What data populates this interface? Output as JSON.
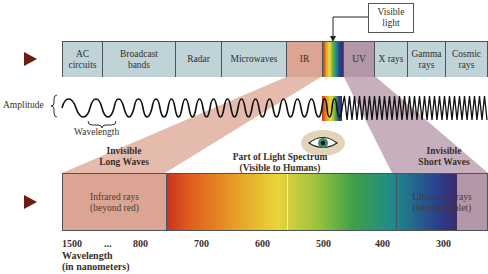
{
  "top_band": {
    "cells": [
      {
        "label": "AC circuits",
        "line1": "AC",
        "line2": "circuits",
        "color": "#bfd3d8"
      },
      {
        "label": "Broadcast bands",
        "line1": "Broadcast",
        "line2": "bands",
        "color": "#bfd3d8"
      },
      {
        "label": "Radar",
        "line1": "Radar",
        "line2": "",
        "color": "#bfd3d8"
      },
      {
        "label": "Microwaves",
        "line1": "Microwaves",
        "line2": "",
        "color": "#bfd3d8"
      },
      {
        "label": "IR",
        "line1": "IR",
        "line2": "",
        "color": "#dca493"
      },
      {
        "label": "Visible",
        "line1": "",
        "line2": "",
        "color": "rainbow"
      },
      {
        "label": "UV",
        "line1": "UV",
        "line2": "",
        "color": "#b396a8"
      },
      {
        "label": "X rays",
        "line1": "X rays",
        "line2": "",
        "color": "#bfd3d8"
      },
      {
        "label": "Gamma rays",
        "line1": "Gamma",
        "line2": "rays",
        "color": "#bfd3d8"
      },
      {
        "label": "Cosmic rays",
        "line1": "Cosmic",
        "line2": "rays",
        "color": "#bfd3d8"
      }
    ]
  },
  "callout": {
    "line1": "Visible",
    "line2": "light"
  },
  "wave": {
    "amplitude_label": "Amplitude",
    "wavelength_label": "Wavelength"
  },
  "sections": {
    "long": {
      "line1": "Invisible",
      "line2": "Long Waves"
    },
    "visible": {
      "line1": "Part of Light Spectrum",
      "line2": "(Visible to Humans)"
    },
    "short": {
      "line1": "Invisible",
      "line2": "Short Waves"
    }
  },
  "spectrum": {
    "infrared": {
      "line1": "Infrared rays",
      "line2": "(beyond red)",
      "color": "#dca493"
    },
    "ultraviolet": {
      "line1": "Ultraviolet rays",
      "line2": "(beyond violet)",
      "color": "#b396a8"
    }
  },
  "axis": {
    "ticks": [
      "1500",
      "...",
      "800",
      "700",
      "600",
      "500",
      "400",
      "300"
    ],
    "label_line1": "Wavelength",
    "label_line2": "(in nanometers)"
  },
  "colors": {
    "arrow": "#6b1d12",
    "band": "#bfd3d8",
    "ir": "#dca493",
    "uv": "#b396a8",
    "border": "#4d5559"
  }
}
